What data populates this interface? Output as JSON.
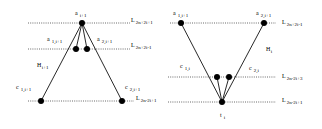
{
  "left_diagram": {
    "levels": [
      {
        "id": "top",
        "name": "L",
        "sub": "2n+2i+1"
      },
      {
        "id": "mid",
        "name": "L",
        "sub": "2n+2i-1"
      },
      {
        "id": "bottom",
        "name": "L",
        "sub": "2n-2i+1"
      }
    ],
    "nodes": [
      {
        "id": "a_top",
        "name": "a",
        "sub": "i+1"
      },
      {
        "id": "a1",
        "name": "a",
        "sub": "1,i+1"
      },
      {
        "id": "a2",
        "name": "a",
        "sub": "2,i+1"
      },
      {
        "id": "c1",
        "name": "c",
        "sub": "1,i+1"
      },
      {
        "id": "c2",
        "name": "c",
        "sub": "2,i+1"
      }
    ],
    "region_label": {
      "name": "H",
      "sub": "i+1"
    }
  },
  "right_diagram": {
    "levels": [
      {
        "id": "top",
        "name": "L",
        "sub": "2n+2i-1"
      },
      {
        "id": "mid",
        "name": "L",
        "sub": "2n-2i+3"
      },
      {
        "id": "bottom",
        "name": "L",
        "sub": "2n-2i+1"
      }
    ],
    "nodes": [
      {
        "id": "a1",
        "name": "a",
        "sub": "1,i+1"
      },
      {
        "id": "a2",
        "name": "a",
        "sub": "2,i+1"
      },
      {
        "id": "c1",
        "name": "c",
        "sub": "1,i"
      },
      {
        "id": "c2",
        "name": "c",
        "sub": "2,i"
      },
      {
        "id": "t",
        "name": "t",
        "sub": "i"
      }
    ],
    "region_label": {
      "name": "H",
      "sub": "i"
    }
  }
}
